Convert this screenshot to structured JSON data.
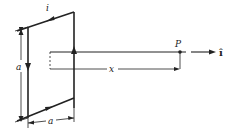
{
  "figure": {
    "type": "physics-diagram",
    "labels": {
      "current": "i",
      "side_vertical": "a",
      "side_horizontal": "a",
      "distance": "x",
      "point": "P",
      "unit_vector": "î"
    },
    "colors": {
      "line": "#222222",
      "background": "#ffffff"
    }
  }
}
